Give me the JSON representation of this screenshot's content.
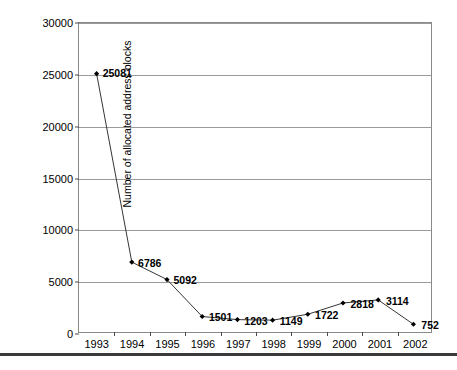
{
  "chart_data": {
    "type": "line",
    "title": "",
    "xlabel": "",
    "ylabel": "Number of allocated address blocks",
    "categories": [
      "1993",
      "1994",
      "1995",
      "1996",
      "1997",
      "1998",
      "1999",
      "2000",
      "2001",
      "2002"
    ],
    "values": [
      25081,
      6786,
      5092,
      1501,
      1203,
      1149,
      1722,
      2818,
      3114,
      752
    ],
    "data_labels": [
      "25081",
      "6786",
      "5092",
      "1501",
      "1203",
      "1149",
      "1722",
      "2818",
      "3114",
      "752"
    ],
    "ylim": [
      0,
      30000
    ],
    "y_ticks": [
      0,
      5000,
      10000,
      15000,
      20000,
      25000,
      30000
    ],
    "y_tick_labels": [
      "0",
      "5000",
      "10000",
      "15000",
      "20000",
      "25000",
      "30000"
    ],
    "grid": true,
    "grid_axis": "y",
    "legend": "none",
    "series_color": "#333333",
    "grid_color": "#9a9a9a",
    "marker": "diamond",
    "marker_color": "#000000"
  },
  "figure": {
    "footer_rule_color": "#3a3a3a"
  }
}
